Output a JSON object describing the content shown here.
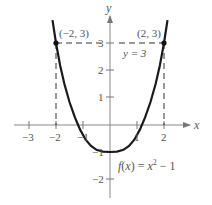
{
  "figure": {
    "function_label": "f(x) = x² − 1",
    "function_label_parts": {
      "f": "f",
      "lp": "(",
      "x": "x",
      "rp": ")",
      "eq": " = ",
      "x2": "x",
      "exp": "2",
      "minus": " − 1"
    },
    "horizontal_line_label": "y = 3",
    "points": [
      {
        "label": "(−2, 3)",
        "x": -2,
        "y": 3
      },
      {
        "label": "(2, 3)",
        "x": 2,
        "y": 3
      }
    ],
    "axes": {
      "x_label": "x",
      "y_label": "y",
      "x_ticks": [
        "−3",
        "−2",
        "−1",
        "1",
        "2"
      ],
      "y_ticks": [
        "3",
        "2",
        "1",
        "−1",
        "−2"
      ]
    },
    "colors": {
      "curve": "#1a1a1a",
      "axes": "#888888",
      "dashed": "#333333",
      "text": "#555555"
    }
  }
}
